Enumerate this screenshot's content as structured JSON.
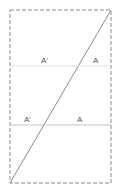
{
  "diagram": {
    "frame": {
      "x": 10,
      "y": 10,
      "width": 101,
      "height": 173,
      "style": "dashed",
      "color": "#8a8a8a"
    },
    "diagonal": {
      "x1": 10,
      "y1": 183,
      "x2": 111,
      "y2": 10,
      "color": "#8a8a8a"
    },
    "lines": [
      {
        "y": 66,
        "color": "#bdbdbd",
        "labels": [
          {
            "text": "A'",
            "x": 42
          },
          {
            "text": "A",
            "x": 94
          }
        ]
      },
      {
        "y": 125,
        "color": "#bdbdbd",
        "labels": [
          {
            "text": "A'",
            "x": 25
          },
          {
            "text": "A",
            "x": 78
          }
        ]
      }
    ]
  },
  "labels": {
    "l1_left": "A'",
    "l1_right": "A",
    "l2_left": "A'",
    "l2_right": "A"
  }
}
